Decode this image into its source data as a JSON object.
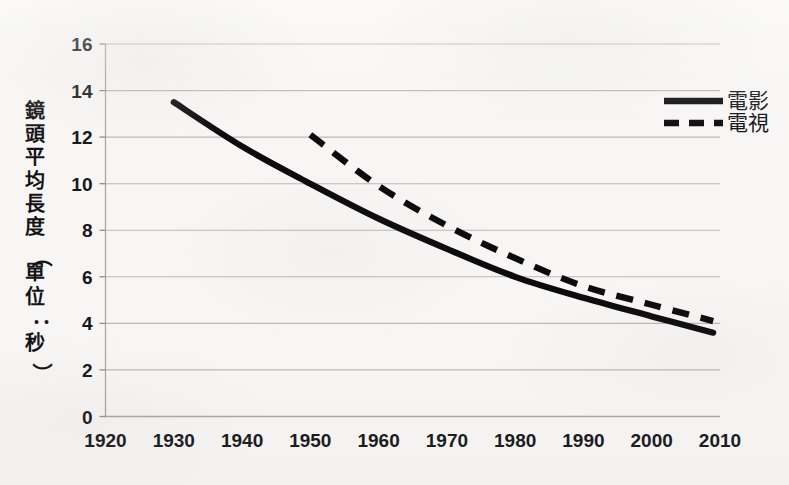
{
  "chart_data": {
    "type": "line",
    "title": "",
    "xlabel": "",
    "ylabel": "鏡頭平均長度（單位：秒）",
    "xlim": [
      1920,
      2010
    ],
    "ylim": [
      0,
      16
    ],
    "grid": true,
    "legend_position": "top-right",
    "x_ticks": [
      "1920",
      "1930",
      "1940",
      "1950",
      "1960",
      "1970",
      "1980",
      "1990",
      "2000",
      "2010"
    ],
    "y_ticks": [
      "0",
      "2",
      "4",
      "6",
      "8",
      "10",
      "12",
      "14",
      "16"
    ],
    "series": [
      {
        "name": "電影",
        "style": "solid",
        "color": "#0b0b0d",
        "x": [
          1930,
          1940,
          1950,
          1960,
          1970,
          1980,
          1990,
          2000,
          2009
        ],
        "values": [
          13.5,
          11.6,
          10.0,
          8.5,
          7.2,
          6.0,
          5.1,
          4.3,
          3.6
        ]
      },
      {
        "name": "電視",
        "style": "dashed",
        "color": "#0b0b0d",
        "x": [
          1950,
          1960,
          1970,
          1980,
          1990,
          2000,
          2009
        ],
        "values": [
          12.1,
          9.9,
          8.2,
          6.8,
          5.6,
          4.8,
          4.1
        ]
      }
    ]
  },
  "axis": {
    "y_title": "鏡頭平均長度（單位：秒）",
    "y_title_chars": [
      "鏡",
      "頭",
      "平",
      "均",
      "長",
      "度",
      "（",
      "單",
      "位",
      "：",
      "秒",
      "）"
    ]
  },
  "legend": {
    "entries": [
      {
        "label": "電影",
        "style": "solid"
      },
      {
        "label": "電視",
        "style": "dashed"
      }
    ]
  }
}
